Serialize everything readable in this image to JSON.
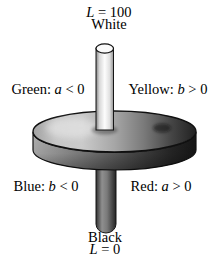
{
  "figure": {
    "top_value": {
      "var": "L",
      "rest": " = 100"
    },
    "top_label": "White",
    "axis_labels": {
      "green": {
        "prefix": "Green: ",
        "var": "a",
        "rest": " < 0"
      },
      "yellow": {
        "prefix": "Yellow: ",
        "var": "b",
        "rest": " > 0"
      },
      "blue": {
        "prefix": "Blue: ",
        "var": "b",
        "rest": " < 0"
      },
      "red": {
        "prefix": "Red: ",
        "var": "a",
        "rest": " > 0"
      }
    },
    "bottom_label": "Black",
    "bottom_value": {
      "var": "L",
      "rest": " = 0"
    }
  },
  "colors": {
    "background": "#ffffff",
    "ink": "#000000",
    "outline": "#111111",
    "disk_face_light": "#cbcbcb",
    "disk_face_dark": "#212121",
    "rim_dark": "#161616",
    "rod_highlight": "#fdfdfd"
  }
}
